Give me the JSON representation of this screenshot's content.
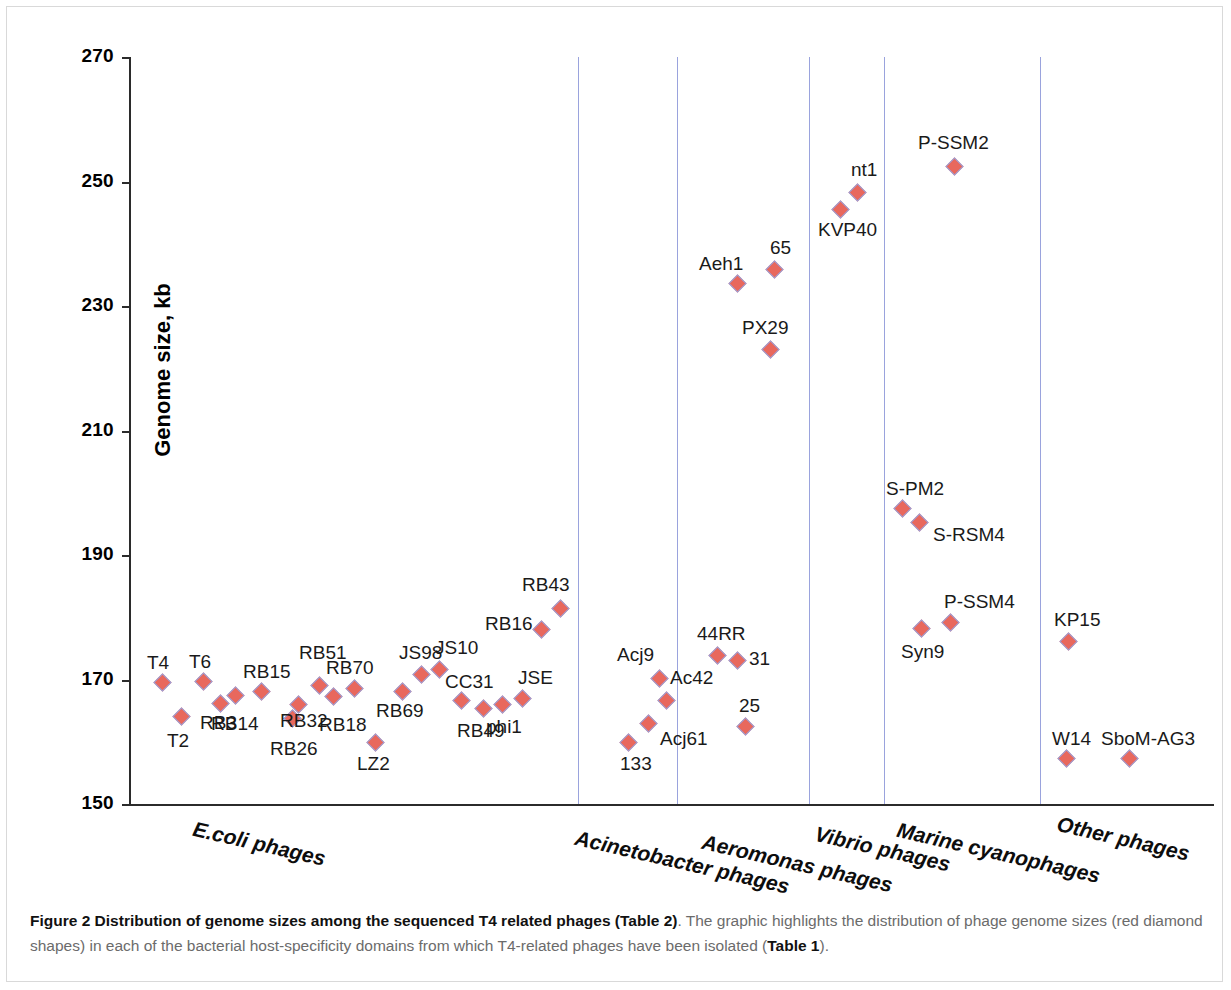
{
  "figure": {
    "caption_label": "Figure 2",
    "caption_title": "Distribution of genome sizes among the sequenced T4 related phages",
    "caption_ref1": "(Table 2)",
    "caption_rest1": ". The graphic highlights the distribution of phage genome sizes (red diamond shapes) in each of the bacterial host-specificity domains from which T4-related phages have been isolated (",
    "caption_ref2": "Table 1",
    "caption_rest2": ")."
  },
  "axes": {
    "y_title": "Genome size, kb",
    "y_ticks": [
      "270",
      "250",
      "230",
      "210",
      "190",
      "170",
      "150"
    ],
    "y_min": 150,
    "y_max": 270
  },
  "chart_data": {
    "type": "scatter",
    "title": "Distribution of genome sizes among the sequenced T4 related phages",
    "xlabel": "",
    "ylabel": "Genome size, kb",
    "ylim": [
      150,
      270
    ],
    "ytick_values": [
      150,
      170,
      190,
      210,
      230,
      250,
      270
    ],
    "grid": false,
    "legend": "none",
    "marker": "red diamond",
    "marker_color": "#e8685d",
    "marker_edge_color": "#9aa3dd",
    "separator_color": "#9aa3dd",
    "categories": [
      "E.coli phages",
      "Acinetobacter phages",
      "Aeromonas phages",
      "Vibrio phages",
      "Marine cyanophages",
      "Other phages"
    ],
    "series": [
      {
        "name": "E.coli phages",
        "points": [
          {
            "label": "T4",
            "x": 33,
            "y": 169.5,
            "lx": -15,
            "ly": -30
          },
          {
            "label": "T2",
            "x": 52,
            "y": 164.0,
            "lx": -14,
            "ly": 14
          },
          {
            "label": "T6",
            "x": 74,
            "y": 169.6,
            "lx": -14,
            "ly": -30
          },
          {
            "label": "RB3",
            "x": 91,
            "y": 166.1,
            "lx": -20,
            "ly": 9
          },
          {
            "label": "RB14",
            "x": 106,
            "y": 167.4,
            "lx": -24,
            "ly": 18
          },
          {
            "label": "RB15",
            "x": 132,
            "y": 168.0,
            "lx": -18,
            "ly": -30
          },
          {
            "label": "RB26",
            "x": 163,
            "y": 163.7,
            "lx": -22,
            "ly": 20
          },
          {
            "label": "RB32",
            "x": 169,
            "y": 166.0,
            "lx": -18,
            "ly": 7
          },
          {
            "label": "RB51",
            "x": 190,
            "y": 169.0,
            "lx": -20,
            "ly": -43
          },
          {
            "label": "RB18",
            "x": 204,
            "y": 167.2,
            "lx": -14,
            "ly": 18
          },
          {
            "label": "RB70",
            "x": 225,
            "y": 168.6,
            "lx": -28,
            "ly": -30
          },
          {
            "label": "LZ2",
            "x": 246,
            "y": 159.9,
            "lx": -18,
            "ly": 12
          },
          {
            "label": "RB69",
            "x": 273,
            "y": 168.1,
            "lx": -26,
            "ly": 10
          },
          {
            "label": "JS98",
            "x": 292,
            "y": 170.8,
            "lx": -22,
            "ly": -32
          },
          {
            "label": "JS10",
            "x": 310,
            "y": 171.6,
            "lx": -4,
            "ly": -32
          },
          {
            "label": "CC31",
            "x": 332,
            "y": 166.7,
            "lx": -16,
            "ly": -28
          },
          {
            "label": "RB49",
            "x": 354,
            "y": 165.3,
            "lx": -26,
            "ly": 12
          },
          {
            "label": "phi1",
            "x": 373,
            "y": 166.0,
            "lx": -16,
            "ly": 13
          },
          {
            "label": "JSE",
            "x": 393,
            "y": 167.0,
            "lx": -4,
            "ly": -30
          },
          {
            "label": "RB16",
            "x": 412,
            "y": 178.0,
            "lx": -56,
            "ly": -16
          },
          {
            "label": "RB43",
            "x": 431,
            "y": 181.4,
            "lx": -38,
            "ly": -34
          }
        ]
      },
      {
        "name": "Acinetobacter phages",
        "points": [
          {
            "label": "133",
            "x": 499,
            "y": 159.9,
            "lx": -8,
            "ly": 12
          },
          {
            "label": "Acj61",
            "x": 519,
            "y": 163.0,
            "lx": 12,
            "ly": 6
          },
          {
            "label": "Acj9",
            "x": 530,
            "y": 170.1,
            "lx": -42,
            "ly": -34
          },
          {
            "label": "Ac42",
            "x": 537,
            "y": 166.7,
            "lx": 4,
            "ly": -32
          }
        ]
      },
      {
        "name": "Aeromonas phages",
        "points": [
          {
            "label": "25",
            "x": 616,
            "y": 162.5,
            "lx": -6,
            "ly": -30
          },
          {
            "label": "31",
            "x": 608,
            "y": 173.0,
            "lx": 12,
            "ly": -12
          },
          {
            "label": "44RR",
            "x": 588,
            "y": 173.8,
            "lx": -20,
            "ly": -32
          },
          {
            "label": "PX29",
            "x": 641,
            "y": 223.0,
            "lx": -28,
            "ly": -32
          },
          {
            "label": "Aeh1",
            "x": 608,
            "y": 233.6,
            "lx": -38,
            "ly": -30
          },
          {
            "label": "65",
            "x": 645,
            "y": 235.8,
            "lx": -4,
            "ly": -32
          }
        ]
      },
      {
        "name": "Vibrio phages",
        "points": [
          {
            "label": "KVP40",
            "x": 711,
            "y": 245.5,
            "lx": -22,
            "ly": 10
          },
          {
            "label": "nt1",
            "x": 728,
            "y": 248.3,
            "lx": -6,
            "ly": -32
          }
        ]
      },
      {
        "name": "Marine cyanophages",
        "points": [
          {
            "label": "Syn9",
            "x": 792,
            "y": 178.2,
            "lx": -20,
            "ly": 14
          },
          {
            "label": "P-SSM4",
            "x": 821,
            "y": 179.2,
            "lx": -6,
            "ly": -30
          },
          {
            "label": "S-PM2",
            "x": 773,
            "y": 197.4,
            "lx": -16,
            "ly": -30
          },
          {
            "label": "S-RSM4",
            "x": 790,
            "y": 195.2,
            "lx": 14,
            "ly": 2
          },
          {
            "label": "P-SSM2",
            "x": 825,
            "y": 252.4,
            "lx": -36,
            "ly": -34
          }
        ]
      },
      {
        "name": "Other phages",
        "points": [
          {
            "label": "KP15",
            "x": 939,
            "y": 176.1,
            "lx": -14,
            "ly": -32
          },
          {
            "label": "W14",
            "x": 937,
            "y": 157.3,
            "lx": -14,
            "ly": -30
          },
          {
            "label": "SboM-AG3",
            "x": 1000,
            "y": 157.3,
            "lx": -28,
            "ly": -30
          }
        ]
      }
    ],
    "separators_x": [
      449,
      548,
      680,
      755,
      911
    ]
  }
}
